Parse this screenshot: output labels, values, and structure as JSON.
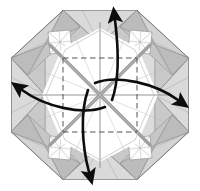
{
  "figure": {
    "type": "origami-diagram",
    "step_label": "",
    "width": 200,
    "height": 191
  },
  "colors": {
    "background": "#ffffff",
    "paper_light": "#fdfdfd",
    "paper_white": "#ffffff",
    "shade_light": "#e2e2e2",
    "shade_mid": "#cfcfcf",
    "shade_dark": "#bdbdbd",
    "shade_darker": "#a8a8a8",
    "outline": "#6e6e6e",
    "outline_soft": "#8d8d8d",
    "crease_gray": "#9a9a9a",
    "crease_gray_thick": "#a0a0a0",
    "dashed_crease": "#4a4a4a",
    "arrow_black": "#0d0d0d"
  },
  "geometry": {
    "center": {
      "x": 100,
      "y": 95
    },
    "octagon_radius": 89,
    "octagon_vertices": [
      {
        "x": 63,
        "y": 10
      },
      {
        "x": 137,
        "y": 10
      },
      {
        "x": 189,
        "y": 58
      },
      {
        "x": 189,
        "y": 132
      },
      {
        "x": 137,
        "y": 180
      },
      {
        "x": 63,
        "y": 180
      },
      {
        "x": 11,
        "y": 132
      },
      {
        "x": 11,
        "y": 58
      }
    ],
    "inner_square": {
      "left": 63,
      "top": 58,
      "right": 137,
      "bottom": 132,
      "style": "dashed"
    },
    "flap_count": 8
  },
  "arrows": [
    {
      "name": "arrow-up",
      "direction": "up",
      "label": "rotate flap upward",
      "head_x": 116,
      "head_y": 14
    },
    {
      "name": "arrow-left",
      "direction": "left",
      "label": "rotate flap left",
      "head_x": 19,
      "head_y": 88
    },
    {
      "name": "arrow-right",
      "direction": "right",
      "label": "rotate flap right",
      "head_x": 182,
      "head_y": 97
    },
    {
      "name": "arrow-down",
      "direction": "down",
      "label": "rotate flap downward",
      "head_x": 92,
      "head_y": 176
    }
  ],
  "legend": {
    "dashed_line_meaning": "valley crease",
    "solid_gray_meaning": "existing crease",
    "arrow_meaning": "rotation / fold direction"
  }
}
